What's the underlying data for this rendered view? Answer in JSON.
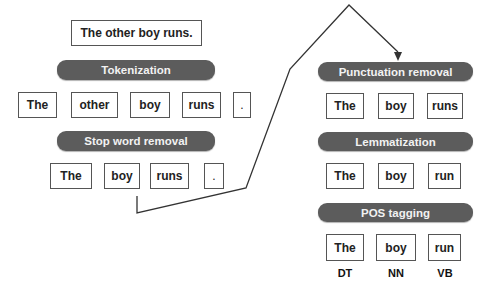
{
  "input_sentence": "The other boy runs.",
  "steps": {
    "tokenization": "Tokenization",
    "stop_word_removal": "Stop word removal",
    "punctuation_removal": "Punctuation removal",
    "lemmatization": "Lemmatization",
    "pos_tagging": "POS tagging"
  },
  "tokens": [
    "The",
    "other",
    "boy",
    "runs",
    "."
  ],
  "after_stop_words": [
    "The",
    "boy",
    "runs",
    "."
  ],
  "after_punctuation": [
    "The",
    "boy",
    "runs"
  ],
  "after_lemmatization": [
    "The",
    "boy",
    "run"
  ],
  "pos_words": [
    "The",
    "boy",
    "run"
  ],
  "pos_tags": [
    "DT",
    "NN",
    "VB"
  ],
  "colors": {
    "bar": "#5c5c5c",
    "bar_text": "#f2f2f2",
    "box_border": "#555555"
  }
}
